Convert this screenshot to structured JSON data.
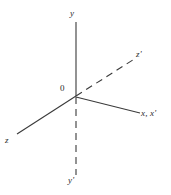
{
  "figure": {
    "background_color": "#ffffff",
    "line_color": "#3a3a3a",
    "text_color": "#2b2b2b"
  },
  "labels": {
    "origin": "0",
    "y": "y",
    "y_prime": "y'",
    "z": "z",
    "z_prime": "z'",
    "x_and_x_prime": "x, x'"
  },
  "axes": [
    {
      "name": "y-axis",
      "label": "y",
      "style": "solid",
      "from": [
        76,
        96
      ],
      "to": [
        76,
        22
      ]
    },
    {
      "name": "y-prime-axis",
      "label": "y'",
      "style": "dashed",
      "from": [
        76,
        97
      ],
      "to": [
        76,
        175
      ]
    },
    {
      "name": "z-axis",
      "label": "z",
      "style": "solid",
      "from": [
        76,
        96
      ],
      "to": [
        17,
        134
      ]
    },
    {
      "name": "z-prime-axis",
      "label": "z'",
      "style": "dashed",
      "from": [
        76,
        96
      ],
      "to": [
        136,
        58
      ]
    },
    {
      "name": "x-axis",
      "label": "x, x'",
      "style": "solid",
      "from": [
        76,
        97
      ],
      "to": [
        140,
        113
      ]
    }
  ],
  "origin_point": [
    76,
    96
  ]
}
